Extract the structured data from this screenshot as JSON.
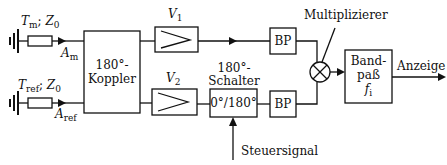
{
  "diagram": {
    "type": "block-diagram",
    "sources": [
      {
        "temp_symbol": "T",
        "temp_sub": "m",
        "impedance": "Z",
        "impedance_sub": "0",
        "output_symbol": "A",
        "output_sub": "m"
      },
      {
        "temp_symbol": "T",
        "temp_sub": "ref",
        "impedance": "Z",
        "impedance_sub": "0",
        "output_symbol": "A",
        "output_sub": "ref"
      }
    ],
    "coupler": {
      "line1": "180°-",
      "line2": "Koppler"
    },
    "amplifiers": [
      {
        "symbol": "V",
        "sub": "1"
      },
      {
        "symbol": "V",
        "sub": "2"
      }
    ],
    "switch": {
      "title1": "180°-",
      "title2": "Schalter",
      "inner": "0°/180°",
      "control_label": "Steuersignal"
    },
    "bandpass_small": [
      {
        "label": "BP"
      },
      {
        "label": "BP"
      }
    ],
    "multiplier": {
      "label": "Multiplizierer"
    },
    "bandpass_out": {
      "line1": "Band-",
      "line2": "paß",
      "symbol": "f",
      "sub": "i"
    },
    "output": {
      "label": "Anzeige"
    }
  }
}
